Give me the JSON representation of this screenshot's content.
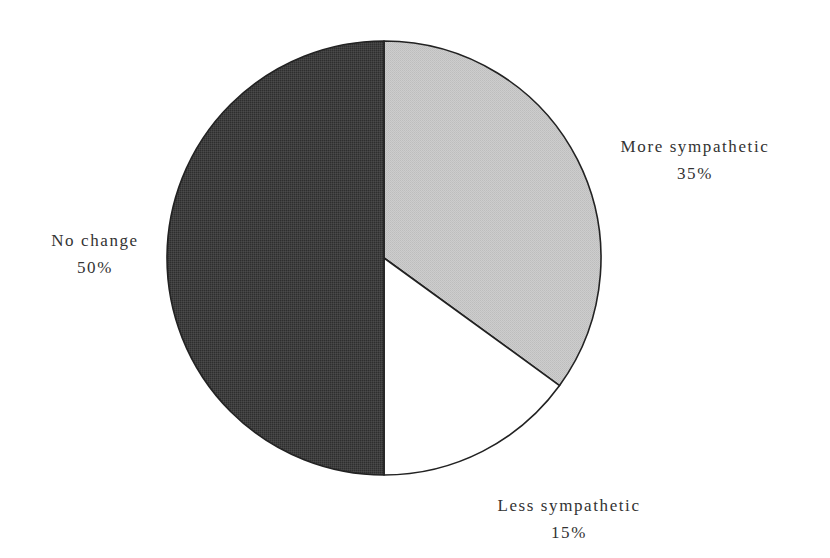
{
  "chart_data": {
    "type": "pie",
    "title": "",
    "categories": [
      "More sympathetic",
      "Less sympathetic",
      "No change"
    ],
    "values": [
      35,
      15,
      50
    ],
    "labels": [
      "35%",
      "15%",
      "50%"
    ],
    "colors": [
      "#c9c9c9",
      "#ffffff",
      "#3b3b3b"
    ],
    "start_angle_deg": 90,
    "direction": "clockwise",
    "outline_color": "#222222",
    "legend": "none (direct labels)"
  },
  "slices": {
    "more": {
      "name": "More sympathetic",
      "pct": "35%"
    },
    "less": {
      "name": "Less sympathetic",
      "pct": "15%"
    },
    "nochange": {
      "name": "No change",
      "pct": "50%"
    }
  }
}
